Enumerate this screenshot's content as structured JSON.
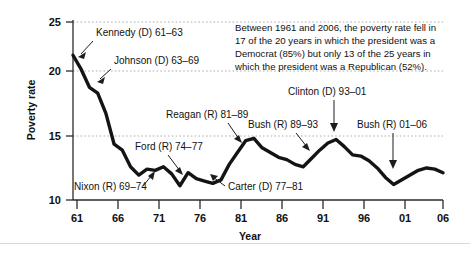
{
  "figure": {
    "name": "poverty-rate-by-president-chart"
  },
  "callout": {
    "name": "statistics-callout",
    "lines": [
      "Between 1961 and 2006, the poverty rate fell in",
      "17 of the 20 years in which the president was a",
      "Democrat (85%) but only 13 of the 25 years in",
      "which the president was a Republican (52%)."
    ]
  },
  "chart_data": {
    "type": "line",
    "title": "",
    "xlabel": "Year",
    "ylabel": "Poverty rate",
    "xlim": [
      1961,
      2006
    ],
    "ylim": [
      10,
      25
    ],
    "grid": true,
    "legend": "none",
    "x_tick_labels": [
      "61",
      "66",
      "71",
      "76",
      "81",
      "86",
      "91",
      "96",
      "01",
      "06"
    ],
    "x_tick_values": [
      1961,
      1966,
      1971,
      1976,
      1981,
      1986,
      1991,
      1996,
      2001,
      2006
    ],
    "y_tick_labels": [
      "10",
      "15",
      "20",
      "25"
    ],
    "y_tick_values": [
      10,
      15,
      20,
      25
    ],
    "series": [
      {
        "name": "Poverty rate",
        "color": "#141414",
        "x": [
          1961,
          1962,
          1963,
          1964,
          1965,
          1966,
          1967,
          1968,
          1969,
          1970,
          1971,
          1972,
          1973,
          1974,
          1975,
          1976,
          1977,
          1978,
          1979,
          1980,
          1981,
          1982,
          1983,
          1984,
          1985,
          1986,
          1987,
          1988,
          1989,
          1990,
          1991,
          1992,
          1993,
          1994,
          1995,
          1996,
          1997,
          1998,
          1999,
          2000,
          2001,
          2002,
          2003,
          2004,
          2005,
          2006
        ],
        "values": [
          22.2,
          21.0,
          19.5,
          19.0,
          17.3,
          14.7,
          14.2,
          12.8,
          12.1,
          12.6,
          12.5,
          12.8,
          12.2,
          11.2,
          12.3,
          11.8,
          11.6,
          11.4,
          11.7,
          13.0,
          14.0,
          15.0,
          15.2,
          14.4,
          14.0,
          13.6,
          13.4,
          13.0,
          12.8,
          13.5,
          14.2,
          14.8,
          15.1,
          14.5,
          13.8,
          13.7,
          13.3,
          12.7,
          11.9,
          11.3,
          11.7,
          12.1,
          12.5,
          12.7,
          12.6,
          12.3
        ]
      }
    ],
    "annotations": [
      {
        "name": "annotation-kennedy",
        "label": "Kennedy (D) 61–63"
      },
      {
        "name": "annotation-johnson",
        "label": "Johnson (D) 63–69"
      },
      {
        "name": "annotation-nixon",
        "label": "Nixon (R) 69–74"
      },
      {
        "name": "annotation-ford",
        "label": "Ford (R) 74–77"
      },
      {
        "name": "annotation-carter",
        "label": "Carter (D) 77–81"
      },
      {
        "name": "annotation-reagan",
        "label": "Reagan (R) 81–89"
      },
      {
        "name": "annotation-bush41",
        "label": "Bush (R) 89–93"
      },
      {
        "name": "annotation-clinton",
        "label": "Clinton (D) 93–01"
      },
      {
        "name": "annotation-bush43",
        "label": "Bush (R) 01–06"
      }
    ]
  }
}
